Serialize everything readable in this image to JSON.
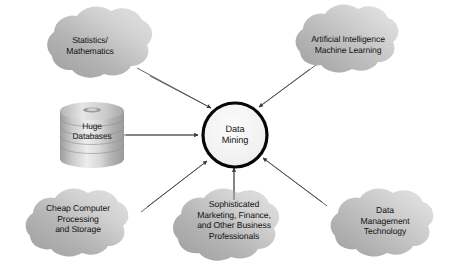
{
  "diagram": {
    "type": "hub-and-spoke",
    "background_color": "#ffffff",
    "text_color": "#141414",
    "cloud_fill_dark": "#a6a6a6",
    "cloud_fill_light": "#dcdcdc",
    "arrow_color": "#3c3c3c",
    "center": {
      "shape": "circle",
      "label": "Data\nMining",
      "line1": "Data",
      "line2": "Mining",
      "fill": "#f2f2f2",
      "stroke": "#000000"
    },
    "nodes": [
      {
        "id": "statistics-mathematics",
        "shape": "cloud",
        "label": "Statistics/\nMathematics",
        "lines": [
          "Statistics/",
          "Mathematics"
        ],
        "position": "top-left"
      },
      {
        "id": "artificial-intelligence",
        "shape": "cloud",
        "label": "Artificial Intelligence\nMachine Learning",
        "lines": [
          "Artificial Intelligence",
          "Machine Learning"
        ],
        "position": "top-right"
      },
      {
        "id": "huge-databases",
        "shape": "cylinder",
        "label": "Huge\nDatabases",
        "lines": [
          "Huge",
          "Databases"
        ],
        "position": "middle-left"
      },
      {
        "id": "cheap-computer-processing",
        "shape": "cloud",
        "label": "Cheap Computer\nProcessing\nand Storage",
        "lines": [
          "Cheap Computer",
          "Processing",
          "and Storage"
        ],
        "position": "bottom-left"
      },
      {
        "id": "sophisticated-professionals",
        "shape": "cloud",
        "label": "Sophisticated\nMarketing, Finance,\nand Other Business\nProfessionals",
        "lines": [
          "Sophisticated",
          "Marketing, Finance,",
          "and Other Business",
          "Professionals"
        ],
        "position": "bottom-center"
      },
      {
        "id": "data-management-technology",
        "shape": "cloud",
        "label": "Data\nManagement\nTechnology",
        "lines": [
          "Data",
          "Management",
          "Technology"
        ],
        "position": "bottom-right"
      }
    ],
    "edges": [
      {
        "from": "statistics-mathematics",
        "to": "center",
        "arrow": "single"
      },
      {
        "from": "artificial-intelligence",
        "to": "center",
        "arrow": "single"
      },
      {
        "from": "huge-databases",
        "to": "center",
        "arrow": "single"
      },
      {
        "from": "cheap-computer-processing",
        "to": "center",
        "arrow": "single"
      },
      {
        "from": "sophisticated-professionals",
        "to": "center",
        "arrow": "single"
      },
      {
        "from": "data-management-technology",
        "to": "center",
        "arrow": "single"
      }
    ]
  }
}
